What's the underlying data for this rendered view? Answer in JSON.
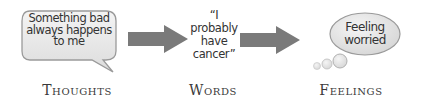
{
  "diagram": {
    "thoughts": {
      "bubble_lines": [
        "Something bad",
        "always happens",
        "to me"
      ],
      "label": "Thoughts"
    },
    "words": {
      "quote_lines": [
        "“I",
        "probably",
        "have",
        "cancer”"
      ],
      "label": "Words"
    },
    "feelings": {
      "bubble_lines": [
        "Feeling",
        "worried"
      ],
      "label": "Feelings"
    },
    "arrows": [
      {
        "from": "thoughts",
        "to": "words"
      },
      {
        "from": "words",
        "to": "feelings"
      }
    ],
    "colors": {
      "arrow": "#7a7a7a",
      "bubble_fill": "#e9e9e9",
      "bubble_stroke": "#9a9a9a",
      "text": "#333333"
    }
  }
}
